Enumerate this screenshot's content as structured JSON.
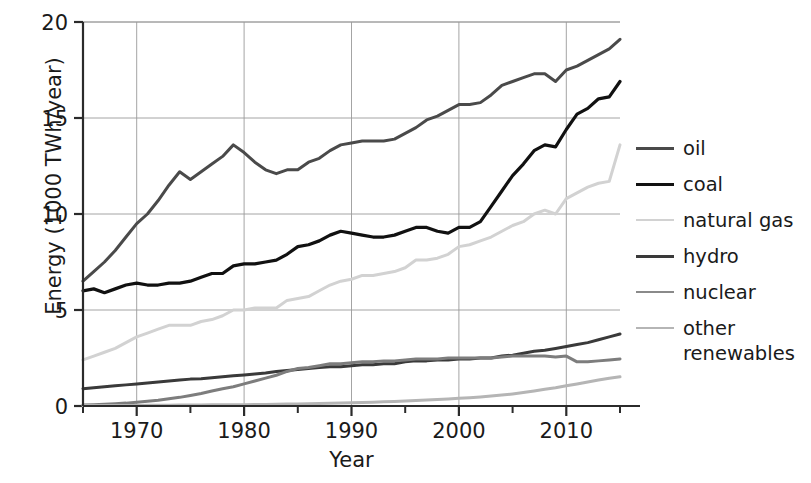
{
  "chart_data": {
    "type": "line",
    "title": "",
    "xlabel": "Year",
    "ylabel": "Energy (1000 TWh/year)",
    "xlim": [
      1965,
      2015
    ],
    "ylim": [
      0,
      20
    ],
    "xticks": [
      1970,
      1980,
      1990,
      2000,
      2010
    ],
    "xtick_labels": [
      "1970",
      "1980",
      "1990",
      "2000",
      "2010"
    ],
    "xminor_ticks": [
      1965,
      1975,
      1985,
      1995,
      2005,
      2015
    ],
    "yticks": [
      0,
      5,
      10,
      15,
      20
    ],
    "ytick_labels": [
      "0",
      "5",
      "10",
      "15",
      "20"
    ],
    "grid": true,
    "grid_axis": "both",
    "legend_position": "right",
    "x": [
      1965,
      1966,
      1967,
      1968,
      1969,
      1970,
      1971,
      1972,
      1973,
      1974,
      1975,
      1976,
      1977,
      1978,
      1979,
      1980,
      1981,
      1982,
      1983,
      1984,
      1985,
      1986,
      1987,
      1988,
      1989,
      1990,
      1991,
      1992,
      1993,
      1994,
      1995,
      1996,
      1997,
      1998,
      1999,
      2000,
      2001,
      2002,
      2003,
      2004,
      2005,
      2006,
      2007,
      2008,
      2009,
      2010,
      2011,
      2012,
      2013,
      2014,
      2015
    ],
    "series": [
      {
        "name": "oil",
        "color": "#4a4a4a",
        "width": 3.0,
        "values": [
          6.5,
          7.0,
          7.5,
          8.1,
          8.8,
          9.5,
          10.0,
          10.7,
          11.5,
          12.2,
          11.8,
          12.2,
          12.6,
          13.0,
          13.6,
          13.2,
          12.7,
          12.3,
          12.1,
          12.3,
          12.3,
          12.7,
          12.9,
          13.3,
          13.6,
          13.7,
          13.8,
          13.8,
          13.8,
          13.9,
          14.2,
          14.5,
          14.9,
          15.1,
          15.4,
          15.7,
          15.7,
          15.8,
          16.2,
          16.7,
          16.9,
          17.1,
          17.3,
          17.3,
          16.9,
          17.5,
          17.7,
          18.0,
          18.3,
          18.6,
          19.1
        ]
      },
      {
        "name": "coal",
        "color": "#111111",
        "width": 3.2,
        "values": [
          6.0,
          6.1,
          5.9,
          6.1,
          6.3,
          6.4,
          6.3,
          6.3,
          6.4,
          6.4,
          6.5,
          6.7,
          6.9,
          6.9,
          7.3,
          7.4,
          7.4,
          7.5,
          7.6,
          7.9,
          8.3,
          8.4,
          8.6,
          8.9,
          9.1,
          9.0,
          8.9,
          8.8,
          8.8,
          8.9,
          9.1,
          9.3,
          9.3,
          9.1,
          9.0,
          9.3,
          9.3,
          9.6,
          10.4,
          11.2,
          12.0,
          12.6,
          13.3,
          13.6,
          13.5,
          14.4,
          15.2,
          15.5,
          16.0,
          16.1,
          16.9
        ]
      },
      {
        "name": "natural gas",
        "color": "#d2d2d2",
        "width": 3.0,
        "values": [
          2.4,
          2.6,
          2.8,
          3.0,
          3.3,
          3.6,
          3.8,
          4.0,
          4.2,
          4.2,
          4.2,
          4.4,
          4.5,
          4.7,
          5.0,
          5.0,
          5.1,
          5.1,
          5.1,
          5.5,
          5.6,
          5.7,
          6.0,
          6.3,
          6.5,
          6.6,
          6.8,
          6.8,
          6.9,
          7.0,
          7.2,
          7.6,
          7.6,
          7.7,
          7.9,
          8.3,
          8.4,
          8.6,
          8.8,
          9.1,
          9.4,
          9.6,
          10.0,
          10.2,
          10.0,
          10.8,
          11.1,
          11.4,
          11.6,
          11.7,
          13.6
        ]
      },
      {
        "name": "hydro",
        "color": "#3a3a3a",
        "width": 3.0,
        "values": [
          0.9,
          0.95,
          1.0,
          1.05,
          1.1,
          1.15,
          1.2,
          1.25,
          1.3,
          1.35,
          1.4,
          1.42,
          1.47,
          1.52,
          1.57,
          1.62,
          1.67,
          1.72,
          1.8,
          1.85,
          1.9,
          1.95,
          2.0,
          2.05,
          2.05,
          2.1,
          2.15,
          2.15,
          2.2,
          2.2,
          2.3,
          2.35,
          2.35,
          2.4,
          2.4,
          2.45,
          2.45,
          2.5,
          2.5,
          2.6,
          2.65,
          2.75,
          2.85,
          2.9,
          3.0,
          3.1,
          3.2,
          3.3,
          3.45,
          3.6,
          3.75
        ]
      },
      {
        "name": "nuclear",
        "color": "#7d7d7d",
        "width": 3.0,
        "values": [
          0.05,
          0.07,
          0.09,
          0.12,
          0.15,
          0.2,
          0.25,
          0.3,
          0.38,
          0.45,
          0.55,
          0.65,
          0.78,
          0.9,
          1.0,
          1.15,
          1.3,
          1.45,
          1.6,
          1.8,
          1.95,
          2.0,
          2.1,
          2.2,
          2.2,
          2.25,
          2.3,
          2.3,
          2.35,
          2.35,
          2.4,
          2.45,
          2.45,
          2.45,
          2.5,
          2.5,
          2.5,
          2.5,
          2.5,
          2.55,
          2.6,
          2.6,
          2.6,
          2.6,
          2.55,
          2.6,
          2.3,
          2.3,
          2.35,
          2.4,
          2.45
        ]
      },
      {
        "name": "other renewables",
        "color": "#b5b5b5",
        "width": 3.0,
        "values": [
          0.02,
          0.02,
          0.02,
          0.03,
          0.03,
          0.03,
          0.04,
          0.04,
          0.04,
          0.05,
          0.05,
          0.05,
          0.06,
          0.06,
          0.07,
          0.07,
          0.08,
          0.08,
          0.09,
          0.1,
          0.11,
          0.12,
          0.13,
          0.14,
          0.15,
          0.17,
          0.18,
          0.2,
          0.22,
          0.24,
          0.26,
          0.29,
          0.31,
          0.34,
          0.37,
          0.4,
          0.43,
          0.47,
          0.52,
          0.57,
          0.63,
          0.7,
          0.78,
          0.87,
          0.95,
          1.05,
          1.15,
          1.25,
          1.35,
          1.45,
          1.52
        ]
      }
    ]
  },
  "legend": {
    "items": [
      {
        "label": "oil",
        "color": "#4a4a4a",
        "width": 3.0
      },
      {
        "label": "coal",
        "color": "#111111",
        "width": 3.4
      },
      {
        "label": "natural gas",
        "color": "#d2d2d2",
        "width": 2.6
      },
      {
        "label": "hydro",
        "color": "#3a3a3a",
        "width": 3.2
      },
      {
        "label": "nuclear",
        "color": "#8a8a8a",
        "width": 2.6
      },
      {
        "label": "other\nrenewables",
        "color": "#b5b5b5",
        "width": 2.6
      }
    ]
  },
  "axes": {
    "ylabel": "Energy (1000 TWh/year)",
    "xlabel": "Year"
  }
}
